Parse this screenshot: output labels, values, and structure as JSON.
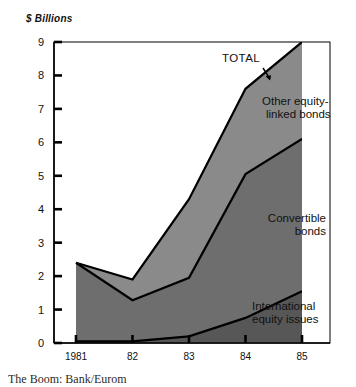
{
  "chart_data": {
    "type": "area",
    "stacked": true,
    "title": "",
    "subtitle": "",
    "xlabel": "",
    "ylabel": "$ Billions",
    "x": [
      1981,
      1982,
      1983,
      1984,
      1985
    ],
    "categories": [
      "1981",
      "82",
      "83",
      "84",
      "85"
    ],
    "xtick_labels": [
      "1981",
      "82",
      "83",
      "84",
      "85"
    ],
    "ytick_labels": [
      "0",
      "1",
      "2",
      "3",
      "4",
      "5",
      "6",
      "7",
      "8",
      "9"
    ],
    "ylim": [
      0,
      9
    ],
    "ytick_step": 1,
    "grid": false,
    "legend_position": "inline-annotations",
    "series": [
      {
        "name": "International equity issues",
        "values": [
          0.05,
          0.05,
          0.2,
          0.75,
          1.55
        ],
        "color": "#575757",
        "cumulative_top": [
          0.05,
          0.05,
          0.2,
          0.75,
          1.55
        ]
      },
      {
        "name": "Convertible bonds",
        "values": [
          2.35,
          1.23,
          1.75,
          4.3,
          4.55
        ],
        "color": "#6e6e6e",
        "cumulative_top": [
          2.4,
          1.28,
          1.95,
          5.05,
          6.1
        ]
      },
      {
        "name": "Other equity-linked bonds",
        "values": [
          0.0,
          0.62,
          2.35,
          2.55,
          2.9
        ],
        "color": "#8a8a8a",
        "cumulative_top": [
          2.4,
          1.9,
          4.3,
          7.6,
          9.0
        ]
      }
    ],
    "total": {
      "name": "TOTAL",
      "values": [
        2.4,
        1.9,
        4.3,
        7.6,
        9.0
      ]
    },
    "annotations": [
      {
        "text": "TOTAL",
        "series": "total"
      },
      {
        "text": "Other equity-\nlinked bonds",
        "series": "Other equity-linked bonds"
      },
      {
        "text": "Convertible\nbonds",
        "series": "Convertible bonds"
      },
      {
        "text": "International\nequity issues",
        "series": "International equity issues"
      }
    ]
  },
  "axis": {
    "y_title": "$ Billions",
    "y_labels": [
      "9",
      "8",
      "7",
      "6",
      "5",
      "4",
      "3",
      "2",
      "1",
      "0"
    ],
    "x_labels": [
      "1981",
      "82",
      "83",
      "84",
      "85"
    ]
  },
  "labels": {
    "total": "TOTAL",
    "other_equity_line1": "Other equity-",
    "other_equity_line2": "linked bonds",
    "convertible_line1": "Convertible",
    "convertible_line2": "bonds",
    "international_line1": "International",
    "international_line2": "equity issues"
  },
  "colors": {
    "band_top": "#8a8a8a",
    "band_middle": "#6e6e6e",
    "band_bottom": "#575757",
    "axis": "#000000",
    "text": "#111111",
    "background": "#ffffff"
  },
  "caption": "The Boom: Bank/Eurom"
}
